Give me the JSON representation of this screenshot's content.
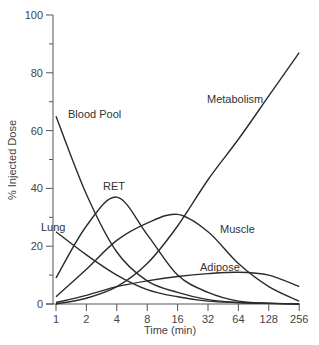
{
  "chart_data": {
    "type": "line",
    "title": "",
    "xlabel": "Time (min)",
    "ylabel": "% Injected Dose",
    "xscale": "log2",
    "xlim": [
      1,
      256
    ],
    "ylim": [
      0,
      100
    ],
    "x_ticks": [
      1,
      2,
      4,
      8,
      16,
      32,
      64,
      128,
      256
    ],
    "y_ticks": [
      0,
      20,
      40,
      60,
      80,
      100
    ],
    "y_minor_ticks": [
      10,
      30,
      50,
      70,
      90
    ],
    "grid": false,
    "legend": "inline labels",
    "x": [
      1,
      2,
      4,
      8,
      16,
      32,
      64,
      128,
      256
    ],
    "series": [
      {
        "name": "Blood Pool",
        "values": [
          65,
          38,
          18,
          8,
          4,
          1.5,
          0.5,
          0.2,
          0
        ]
      },
      {
        "name": "RET",
        "values": [
          9,
          27,
          37,
          24,
          10,
          4,
          1,
          0.3,
          0
        ]
      },
      {
        "name": "Lung",
        "values": [
          25,
          17,
          10,
          5,
          2.5,
          1,
          0.5,
          0.2,
          0
        ]
      },
      {
        "name": "Muscle",
        "values": [
          2.5,
          12,
          22,
          28,
          31,
          25,
          14,
          6,
          1
        ]
      },
      {
        "name": "Adipose",
        "values": [
          0.5,
          3,
          6,
          8,
          9.5,
          10.5,
          11,
          10,
          6
        ]
      },
      {
        "name": "Metabolism",
        "values": [
          0,
          2,
          6,
          14,
          27,
          43,
          57,
          72,
          87
        ]
      }
    ],
    "labels": {
      "blood_pool": "Blood Pool",
      "ret": "RET",
      "lung": "Lung",
      "muscle": "Muscle",
      "adipose": "Adipose",
      "metabolism": "Metabolism"
    }
  }
}
